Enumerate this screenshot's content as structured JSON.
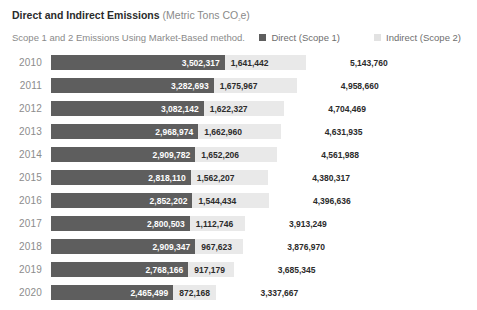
{
  "header": {
    "title_main": "Direct and Indirect Emissions",
    "title_unit_pre": " (Metric Tons CO",
    "title_unit_sub": "2",
    "title_unit_post": "e)",
    "subtitle": "Scope 1 and 2 Emissions Using Market-Based method.",
    "legend": [
      {
        "label": "Direct (Scope 1)",
        "color": "#5e5e5e",
        "icon": "legend-swatch-direct"
      },
      {
        "label": "Indirect (Scope 2)",
        "color": "#e2e2e2",
        "icon": "legend-swatch-indirect"
      }
    ]
  },
  "chart_data": {
    "type": "bar",
    "orientation": "horizontal",
    "stacked": true,
    "title": "Direct and Indirect Emissions (Metric Tons CO2e)",
    "subtitle": "Scope 1 and 2 Emissions Using Market-Based method.",
    "xlabel": "",
    "ylabel": "",
    "grid": false,
    "legend_position": "top-right",
    "categories": [
      "2010",
      "2011",
      "2012",
      "2013",
      "2014",
      "2015",
      "2016",
      "2017",
      "2018",
      "2019",
      "2020"
    ],
    "series": [
      {
        "name": "Direct (Scope 1)",
        "color": "#5e5e5e",
        "values": [
          3502317,
          3282693,
          3082142,
          2968974,
          2909782,
          2818110,
          2852202,
          2800503,
          2909347,
          2768166,
          2465499
        ],
        "labels": [
          "3,502,317",
          "3,282,693",
          "3,082,142",
          "2,968,974",
          "2,909,782",
          "2,818,110",
          "2,852,202",
          "2,800,503",
          "2,909,347",
          "2,768,166",
          "2,465,499"
        ]
      },
      {
        "name": "Indirect (Scope 2)",
        "color": "#e9e9e9",
        "values": [
          1641442,
          1675967,
          1622327,
          1662960,
          1652206,
          1562207,
          1544434,
          1112746,
          967623,
          917179,
          872168
        ],
        "labels": [
          "1,641,442",
          "1,675,967",
          "1,622,327",
          "1,662,960",
          "1,652,206",
          "1,562,207",
          "1,544,434",
          "1,112,746",
          "967,623",
          "917,179",
          "872,168"
        ]
      }
    ],
    "totals": [
      5143760,
      4958660,
      4704469,
      4631935,
      4561988,
      4380317,
      4396636,
      3913249,
      3876970,
      3685345,
      3337667
    ],
    "total_labels": [
      "5,143,760",
      "4,958,660",
      "4,704,469",
      "4,631,935",
      "4,561,988",
      "4,380,317",
      "4,396,636",
      "3,913,249",
      "3,876,970",
      "3,685,345",
      "3,337,667"
    ],
    "xlim": [
      0,
      6200000
    ]
  },
  "rows": [
    {
      "year": "2010",
      "direct": "3,502,317",
      "indirect": "1,641,442",
      "total": "5,143,760"
    },
    {
      "year": "2011",
      "direct": "3,282,693",
      "indirect": "1,675,967",
      "total": "4,958,660"
    },
    {
      "year": "2012",
      "direct": "3,082,142",
      "indirect": "1,622,327",
      "total": "4,704,469"
    },
    {
      "year": "2013",
      "direct": "2,968,974",
      "indirect": "1,662,960",
      "total": "4,631,935"
    },
    {
      "year": "2014",
      "direct": "2,909,782",
      "indirect": "1,652,206",
      "total": "4,561,988"
    },
    {
      "year": "2015",
      "direct": "2,818,110",
      "indirect": "1,562,207",
      "total": "4,380,317"
    },
    {
      "year": "2016",
      "direct": "2,852,202",
      "indirect": "1,544,434",
      "total": "4,396,636"
    },
    {
      "year": "2017",
      "direct": "2,800,503",
      "indirect": "1,112,746",
      "total": "3,913,249"
    },
    {
      "year": "2018",
      "direct": "2,909,347",
      "indirect": "967,623",
      "total": "3,876,970"
    },
    {
      "year": "2019",
      "direct": "2,768,166",
      "indirect": "917,179",
      "total": "3,685,345"
    },
    {
      "year": "2020",
      "direct": "2,465,499",
      "indirect": "872,168",
      "total": "3,337,667"
    }
  ]
}
